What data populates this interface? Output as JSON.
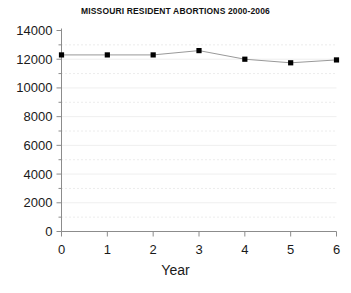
{
  "chart_data": {
    "type": "line",
    "title": "MISSOURI RESIDENT ABORTIONS 2000-2006",
    "xlabel": "Year",
    "ylabel": "",
    "x": [
      0,
      1,
      2,
      3,
      4,
      5,
      6
    ],
    "values": [
      12300,
      12300,
      12300,
      12600,
      12000,
      11750,
      11950
    ],
    "series": [
      {
        "name": "Missouri resident abortions",
        "values": [
          12300,
          12300,
          12300,
          12600,
          12000,
          11750,
          11950
        ]
      }
    ],
    "xlim": [
      0,
      6
    ],
    "ylim": [
      0,
      14000
    ],
    "xticks": [
      0,
      1,
      2,
      3,
      4,
      5,
      6
    ],
    "xtick_labels": [
      "0",
      "1",
      "2",
      "3",
      "4",
      "5",
      "6"
    ],
    "yticks": [
      0,
      2000,
      4000,
      6000,
      8000,
      10000,
      12000,
      14000
    ],
    "ytick_labels": [
      "0",
      "2000",
      "4000",
      "6000",
      "8000",
      "10000",
      "12000",
      "14000"
    ],
    "minor_yticks": [
      1000,
      3000,
      5000,
      7000,
      9000,
      11000,
      13000
    ],
    "grid": "horizontal-dotted-minor",
    "legend": "none",
    "marker": "filled-square",
    "line_color": "#999999",
    "marker_color": "#000000",
    "axis_color": "#8c8c8c",
    "grid_color": "#d8d8d8",
    "background": "#ffffff"
  }
}
